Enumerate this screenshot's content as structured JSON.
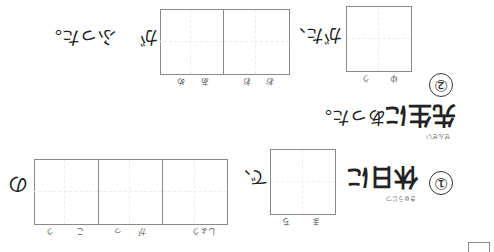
{
  "worksheet": {
    "title": "漢字の読み書き練習",
    "q2": {
      "number": "②",
      "box1": {
        "furigana": [
          "ゆ",
          "う"
        ],
        "answer_hidden": "夕"
      },
      "after_box1": "がた、",
      "box2": {
        "furigana": [
          "お",
          "お",
          "あ",
          "め"
        ],
        "answer_hidden": "大雨"
      },
      "after_box2": "が",
      "ending": "ふった。"
    },
    "q_sensei": {
      "kanji": "先生に",
      "kanji_furigana": "せんせい",
      "ending": "あった。"
    },
    "q1": {
      "number": "①",
      "kanji": "休日に",
      "kanji_furigana": "きゅうじつ",
      "box1": {
        "furigana": [
          "ま",
          "ち"
        ]
      },
      "after_box1": "で、",
      "box2": {
        "furigana": [
          "しょう",
          "が",
          "っ",
          "こ",
          "う"
        ]
      },
      "after_box2": "の"
    },
    "colors": {
      "box_border": "#8a8a8a",
      "text": "#222222"
    }
  }
}
